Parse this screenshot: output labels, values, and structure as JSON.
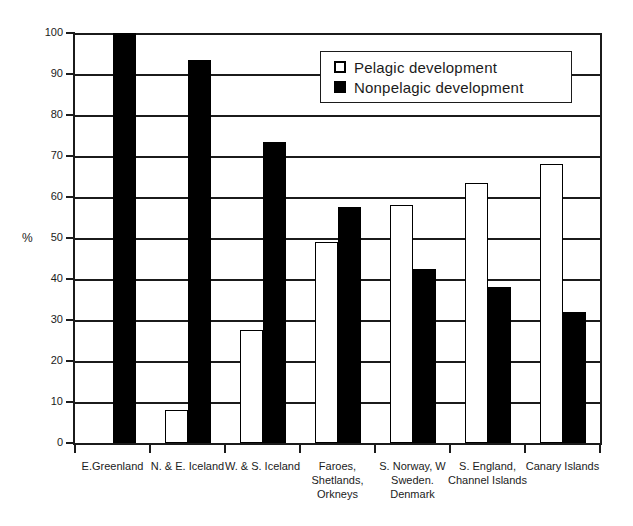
{
  "chart_data": {
    "type": "bar",
    "title": "",
    "xlabel": "",
    "ylabel": "%",
    "ylim": [
      0,
      100
    ],
    "yticks": [
      0,
      10,
      20,
      30,
      40,
      50,
      60,
      70,
      80,
      90,
      100
    ],
    "grid": "horizontal",
    "legend_position": "top-right-inside",
    "categories": [
      "E.Greenland",
      "N. & E. Iceland",
      "W. & S. Iceland",
      "Faroes, Shetlands, Orkneys",
      "S. Norway, W Sweden. Denmark",
      "S. England, Channel Islands",
      "Canary Islands"
    ],
    "category_label_lines": [
      [
        "E.Greenland"
      ],
      [
        "N. & E. Iceland"
      ],
      [
        "W. & S. Iceland"
      ],
      [
        "Faroes,",
        "Shetlands,",
        "Orkneys"
      ],
      [
        "S. Norway,  W",
        "Sweden.",
        "Denmark"
      ],
      [
        "S. England,",
        "Channel Islands"
      ],
      [
        "Canary Islands"
      ]
    ],
    "series": [
      {
        "name": "Pelagic development",
        "fill": "#ffffff",
        "outline": "#000000",
        "values": [
          0,
          8,
          27.5,
          49,
          58,
          63.5,
          68
        ]
      },
      {
        "name": "Nonpelagic development",
        "fill": "#000000",
        "outline": "#000000",
        "values": [
          100,
          93.5,
          73.5,
          57.5,
          42.5,
          38,
          32
        ]
      }
    ]
  },
  "colors": {
    "background": "#ffffff",
    "axis": "#1b1b1b",
    "grid": "#1b1b1b",
    "bar_pelagic": "#ffffff",
    "bar_nonpelagic": "#000000"
  }
}
